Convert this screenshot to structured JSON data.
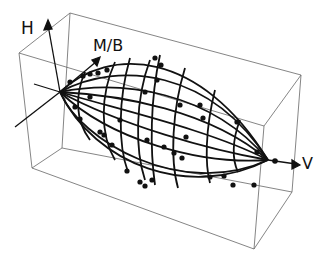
{
  "diagram": {
    "type": "3d-wireframe",
    "axes": {
      "vertical": "H",
      "depth": "M/B",
      "horizontal": "V"
    },
    "colors": {
      "background": "#ffffff",
      "ink": "#111111",
      "box": "#555555"
    }
  }
}
